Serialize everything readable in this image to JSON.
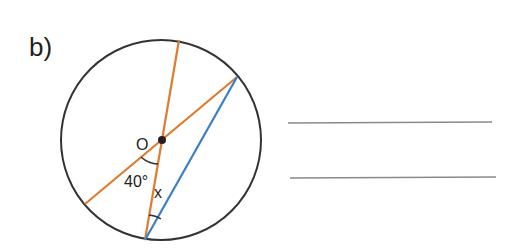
{
  "question": {
    "label": "b)"
  },
  "figure": {
    "center_label": "O",
    "given_angle": "40°",
    "unknown_angle": "x",
    "colors": {
      "circle": "#333333",
      "diameters": "#e07b2e",
      "chord": "#3a7fc6",
      "answer_lines": "#8a8a8a"
    }
  },
  "answer_lines": {
    "count": 2
  }
}
